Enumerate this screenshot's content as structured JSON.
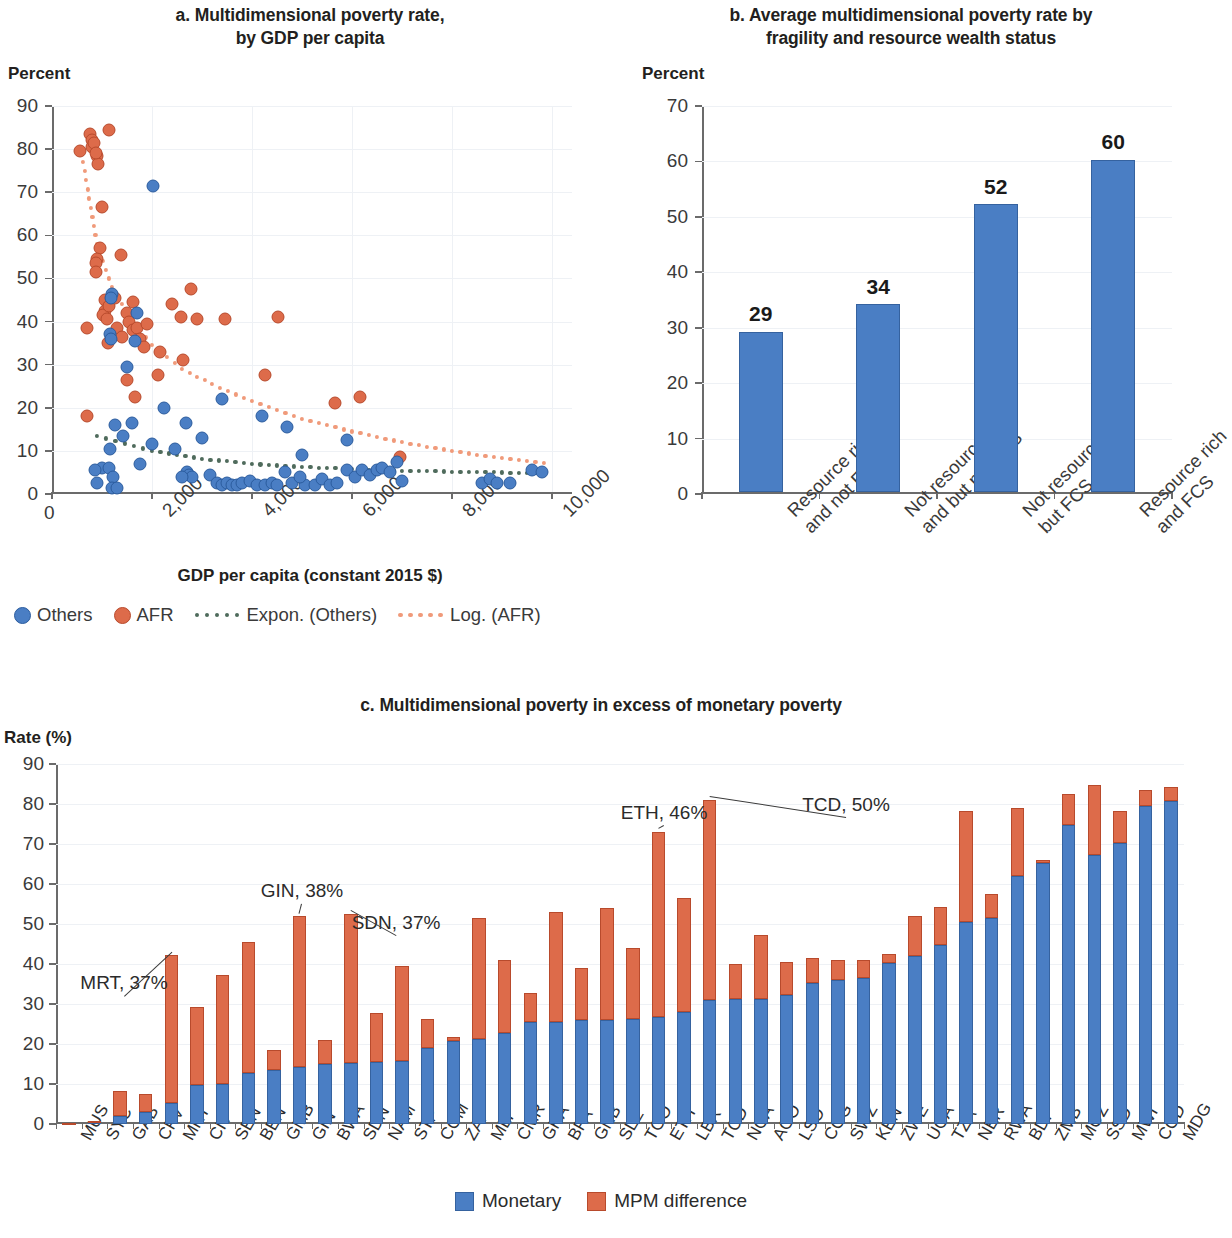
{
  "colors": {
    "blue": "#4a7ec4",
    "orange": "#dd6b4a",
    "trend_others": "#4f6b5c",
    "trend_afr": "#f09a7a",
    "grid": "#eef1f5",
    "axis": "#6b6b6b"
  },
  "panel_a": {
    "title_line1": "a. Multidimensional poverty rate,",
    "title_line2": "by GDP per capita",
    "unit_label": "Percent",
    "x_axis_title": "GDP per capita (constant 2015 $)",
    "legend": [
      {
        "name": "legend-others",
        "label": "Others",
        "marker": "circle",
        "color": "#4a7ec4"
      },
      {
        "name": "legend-afr",
        "label": "AFR",
        "marker": "circle",
        "color": "#dd6b4a"
      },
      {
        "name": "legend-expon-others",
        "label": "Expon. (Others)",
        "marker": "dotted-line",
        "color": "#4f6b5c"
      },
      {
        "name": "legend-log-afr",
        "label": "Log. (AFR)",
        "marker": "dotted-line",
        "color": "#f09a7a"
      }
    ]
  },
  "panel_b": {
    "title_line1": "b. Average multidimensional poverty rate by",
    "title_line2": "fragility and resource wealth status",
    "unit_label": "Percent"
  },
  "panel_c": {
    "title": "c. Multidimensional poverty in excess of monetary poverty",
    "unit_label": "Rate (%)",
    "legend": [
      {
        "name": "legend-monetary",
        "label": "Monetary",
        "color": "#4a7ec4"
      },
      {
        "name": "legend-mpm-difference",
        "label": "MPM difference",
        "color": "#dd6b4a"
      }
    ]
  },
  "chart_data": [
    {
      "id": "panel_a",
      "type": "scatter",
      "title": "a. Multidimensional poverty rate, by GDP per capita",
      "xlabel": "GDP per capita (constant 2015 $)",
      "ylabel": "Percent",
      "xlim": [
        0,
        10400
      ],
      "ylim": [
        0,
        90
      ],
      "xticks": [
        0,
        2000,
        4000,
        6000,
        8000,
        10000
      ],
      "xtick_labels": [
        "0",
        "2,000",
        "4,000",
        "6,000",
        "8,000",
        "10,000"
      ],
      "yticks": [
        0,
        10,
        20,
        30,
        40,
        50,
        60,
        70,
        80,
        90
      ],
      "ytick_labels": [
        "0",
        "10",
        "20",
        "30",
        "40",
        "50",
        "60",
        "70",
        "80",
        "90"
      ],
      "grid": true,
      "legend_position": "below",
      "series": [
        {
          "name": "AFR",
          "color": "#dd6b4a",
          "points": [
            [
              560,
              79.5
            ],
            [
              760,
              83.5
            ],
            [
              790,
              82.0
            ],
            [
              800,
              80.5
            ],
            [
              840,
              81.5
            ],
            [
              900,
              78.5
            ],
            [
              920,
              76.5
            ],
            [
              880,
              79.0
            ],
            [
              1130,
              84.5
            ],
            [
              700,
              38.5
            ],
            [
              1000,
              66.5
            ],
            [
              960,
              57.0
            ],
            [
              900,
              54.5
            ],
            [
              870,
              53.5
            ],
            [
              880,
              51.5
            ],
            [
              1370,
              55.5
            ],
            [
              1060,
              45.0
            ],
            [
              1050,
              42.5
            ],
            [
              1020,
              41.5
            ],
            [
              1100,
              40.5
            ],
            [
              1140,
              43.5
            ],
            [
              1260,
              45.5
            ],
            [
              1500,
              42.0
            ],
            [
              1620,
              44.5
            ],
            [
              1290,
              38.5
            ],
            [
              1400,
              36.5
            ],
            [
              1530,
              40.0
            ],
            [
              1610,
              38.0
            ],
            [
              1700,
              38.5
            ],
            [
              1900,
              39.5
            ],
            [
              1760,
              36.0
            ],
            [
              1120,
              35.0
            ],
            [
              1840,
              34.0
            ],
            [
              2150,
              33.0
            ],
            [
              2400,
              44.0
            ],
            [
              2570,
              41.0
            ],
            [
              2780,
              47.5
            ],
            [
              2900,
              40.5
            ],
            [
              3450,
              40.5
            ],
            [
              2120,
              27.5
            ],
            [
              1650,
              22.5
            ],
            [
              1500,
              26.5
            ],
            [
              700,
              18.0
            ],
            [
              2620,
              31.0
            ],
            [
              4520,
              41.0
            ],
            [
              4250,
              27.5
            ],
            [
              5650,
              21.0
            ],
            [
              6150,
              22.5
            ],
            [
              6950,
              8.5
            ]
          ]
        },
        {
          "name": "Others",
          "color": "#4a7ec4",
          "points": [
            [
              2020,
              71.5
            ],
            [
              1700,
              42.0
            ],
            [
              1200,
              46.5
            ],
            [
              1180,
              45.5
            ],
            [
              1150,
              37.0
            ],
            [
              1180,
              36.0
            ],
            [
              1660,
              35.5
            ],
            [
              1500,
              29.5
            ],
            [
              2230,
              20.0
            ],
            [
              3400,
              22.0
            ],
            [
              1250,
              16.0
            ],
            [
              1600,
              16.5
            ],
            [
              1150,
              10.5
            ],
            [
              2000,
              11.5
            ],
            [
              1420,
              13.5
            ],
            [
              3000,
              13.0
            ],
            [
              2450,
              10.5
            ],
            [
              1000,
              6.0
            ],
            [
              1140,
              6.0
            ],
            [
              1760,
              7.0
            ],
            [
              860,
              5.5
            ],
            [
              1220,
              4.0
            ],
            [
              900,
              2.5
            ],
            [
              1200,
              1.5
            ],
            [
              1300,
              1.5
            ],
            [
              2700,
              5.0
            ],
            [
              2730,
              4.5
            ],
            [
              2800,
              4.0
            ],
            [
              2600,
              4.0
            ],
            [
              3150,
              4.5
            ],
            [
              3300,
              2.5
            ],
            [
              3400,
              2.0
            ],
            [
              3500,
              2.5
            ],
            [
              3600,
              2.0
            ],
            [
              3700,
              2.0
            ],
            [
              3800,
              2.5
            ],
            [
              3950,
              3.0
            ],
            [
              4100,
              2.0
            ],
            [
              4250,
              2.0
            ],
            [
              4400,
              2.5
            ],
            [
              4500,
              2.0
            ],
            [
              4650,
              5.0
            ],
            [
              4800,
              2.5
            ],
            [
              5050,
              2.0
            ],
            [
              5250,
              2.0
            ],
            [
              5400,
              3.5
            ],
            [
              5550,
              2.0
            ],
            [
              5700,
              2.5
            ],
            [
              5900,
              5.5
            ],
            [
              6050,
              4.0
            ],
            [
              6200,
              5.5
            ],
            [
              6350,
              4.5
            ],
            [
              6500,
              5.5
            ],
            [
              6600,
              6.0
            ],
            [
              6750,
              5.0
            ],
            [
              6900,
              7.5
            ],
            [
              7000,
              3.0
            ],
            [
              5000,
              9.0
            ],
            [
              5900,
              12.5
            ],
            [
              4700,
              15.5
            ],
            [
              2680,
              16.5
            ],
            [
              8600,
              2.5
            ],
            [
              8750,
              3.5
            ],
            [
              8900,
              2.5
            ],
            [
              9150,
              2.5
            ],
            [
              9600,
              5.5
            ],
            [
              9800,
              5.0
            ],
            [
              4200,
              18.0
            ],
            [
              4950,
              4.0
            ]
          ]
        }
      ],
      "trendlines": [
        {
          "name": "Expon. (Others)",
          "style": "dotted",
          "color": "#4f6b5c",
          "points": [
            [
              900,
              13.5
            ],
            [
              2000,
              10.0
            ],
            [
              3000,
              8.2
            ],
            [
              4000,
              7.0
            ],
            [
              5000,
              6.3
            ],
            [
              6000,
              5.8
            ],
            [
              7000,
              5.4
            ],
            [
              8000,
              5.2
            ],
            [
              9000,
              5.0
            ],
            [
              10000,
              4.8
            ]
          ]
        },
        {
          "name": "Log. (AFR)",
          "style": "dotted",
          "color": "#f09a7a",
          "points": [
            [
              620,
              77.0
            ],
            [
              900,
              58.0
            ],
            [
              1200,
              48.0
            ],
            [
              1600,
              40.0
            ],
            [
              2000,
              34.5
            ],
            [
              2600,
              29.0
            ],
            [
              3200,
              25.5
            ],
            [
              4000,
              21.5
            ],
            [
              5000,
              17.5
            ],
            [
              6000,
              14.5
            ],
            [
              7000,
              12.0
            ],
            [
              8000,
              10.0
            ],
            [
              9000,
              8.3
            ],
            [
              10000,
              7.0
            ]
          ]
        }
      ]
    },
    {
      "id": "panel_b",
      "type": "bar",
      "title": "b. Average multidimensional poverty rate by fragility and resource wealth status",
      "xlabel": "",
      "ylabel": "Percent",
      "ylim": [
        0,
        70
      ],
      "yticks": [
        0,
        10,
        20,
        30,
        40,
        50,
        60,
        70
      ],
      "ytick_labels": [
        "0",
        "10",
        "20",
        "30",
        "40",
        "50",
        "60",
        "70"
      ],
      "grid": true,
      "categories": [
        "Resource rich\nand not FCS",
        "Not resource rich\nand but not FCS",
        "Not resource rich\nbut FCS",
        "Resource rich\nand FCS"
      ],
      "category_lines": [
        [
          "Resource rich",
          "and not FCS"
        ],
        [
          "Not resource rich",
          "and but not FCS"
        ],
        [
          "Not resource rich",
          "but FCS"
        ],
        [
          "Resource rich",
          "and FCS"
        ]
      ],
      "values": [
        29,
        34,
        52,
        60
      ],
      "value_labels": [
        "29",
        "34",
        "52",
        "60"
      ],
      "color": "#4a7ec4"
    },
    {
      "id": "panel_c",
      "type": "bar",
      "subtype": "stacked",
      "title": "c. Multidimensional poverty in excess of monetary poverty",
      "xlabel": "",
      "ylabel": "Rate (%)",
      "ylim": [
        0,
        90
      ],
      "yticks": [
        0,
        10,
        20,
        30,
        40,
        50,
        60,
        70,
        80,
        90
      ],
      "ytick_labels": [
        "0",
        "10",
        "20",
        "30",
        "40",
        "50",
        "60",
        "70",
        "80",
        "90"
      ],
      "grid": true,
      "legend_position": "below",
      "categories": [
        "MUS",
        "SYC",
        "GAB",
        "CPV",
        "MRT",
        "CIV",
        "SEN",
        "BEN",
        "GMB",
        "GIN",
        "BWA",
        "SDN",
        "NAM",
        "STP",
        "COM",
        "ZAF",
        "MLI",
        "CMR",
        "GHA",
        "BFA",
        "GNB",
        "SLE",
        "TGO",
        "ETH",
        "LBR",
        "TCD",
        "NGA",
        "AGO",
        "LSO",
        "COG",
        "SWZ",
        "KEN",
        "ZWE",
        "UGA",
        "TZA",
        "NER",
        "RWA",
        "BDI",
        "ZMB",
        "MOZ",
        "SSD",
        "MWI",
        "COD",
        "MDG"
      ],
      "series": [
        {
          "name": "Monetary",
          "color": "#4a7ec4",
          "values": [
            0.2,
            0.5,
            2.0,
            3.0,
            5.3,
            9.8,
            10.0,
            12.8,
            13.5,
            14.2,
            15.1,
            15.3,
            15.5,
            15.8,
            19.0,
            20.7,
            21.2,
            22.8,
            25.5,
            25.5,
            26.0,
            26.0,
            26.2,
            26.8,
            28.0,
            31.0,
            31.2,
            31.2,
            32.3,
            35.2,
            36.0,
            36.5,
            40.2,
            42.0,
            44.8,
            50.5,
            51.5,
            62.0,
            65.2,
            74.8,
            67.2,
            70.2,
            79.5,
            80.8
          ]
        },
        {
          "name": "MPM difference",
          "color": "#dd6b4a",
          "values": [
            0.1,
            0.3,
            6.3,
            4.4,
            36.9,
            19.5,
            27.2,
            32.7,
            5.0,
            37.7,
            5.9,
            37.2,
            12.2,
            23.8,
            7.2,
            1.1,
            30.2,
            18.3,
            7.3,
            27.6,
            13.0,
            28.0,
            17.8,
            46.2,
            28.6,
            50.0,
            8.8,
            16.0,
            8.2,
            6.4,
            4.9,
            4.6,
            2.2,
            10.0,
            9.5,
            27.8,
            5.9,
            17.0,
            0.9,
            7.6,
            17.6,
            8.1,
            3.9,
            3.4
          ]
        }
      ],
      "annotations": [
        {
          "name": "annotation-mrt",
          "label": "MRT, 37%",
          "category": "MRT",
          "value": 37
        },
        {
          "name": "annotation-gin",
          "label": "GIN, 38%",
          "category": "GIN",
          "value": 38
        },
        {
          "name": "annotation-sdn",
          "label": "SDN, 37%",
          "category": "SDN",
          "value": 37
        },
        {
          "name": "annotation-eth",
          "label": "ETH, 46%",
          "category": "ETH",
          "value": 46
        },
        {
          "name": "annotation-tcd",
          "label": "TCD, 50%",
          "category": "TCD",
          "value": 50
        }
      ]
    }
  ]
}
